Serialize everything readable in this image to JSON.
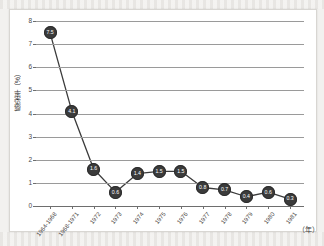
{
  "figure": {
    "background_color": "#f2f1ef",
    "card_color": "#ffffff",
    "marker_color": "#3b3b3b",
    "line_color": "#3b3b3b",
    "grid_color": "#9a9a9a"
  },
  "chart_data": {
    "type": "line",
    "title": "",
    "xlabel": "（年）",
    "ylabel": "感染率（%）",
    "ylim": [
      0,
      8
    ],
    "yticks": [
      "0",
      "1",
      "2",
      "3",
      "4",
      "5",
      "6",
      "7",
      "8"
    ],
    "grid": true,
    "legend": "none",
    "categories": [
      "1964-1968",
      "1968-1971",
      "1972",
      "1973",
      "1974",
      "1975",
      "1976",
      "1977",
      "1978",
      "1979",
      "1980",
      "1981"
    ],
    "values": [
      7.5,
      4.1,
      1.6,
      0.6,
      1.4,
      1.5,
      1.5,
      0.8,
      0.7,
      0.4,
      0.6,
      0.3
    ],
    "point_labels": [
      "7.5",
      "4.1",
      "1.6",
      "0.6",
      "1.4",
      "1.5",
      "1.5",
      "0.8",
      "0.7",
      "0.4",
      "0.6",
      "0.3"
    ]
  }
}
